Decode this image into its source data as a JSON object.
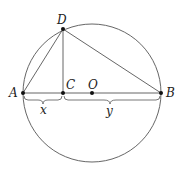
{
  "diagram": {
    "type": "geometry",
    "circle": {
      "center": "O",
      "cx": 92,
      "cy": 93,
      "r": 69
    },
    "points": {
      "A": {
        "label": "A",
        "x": 23,
        "y": 93
      },
      "B": {
        "label": "B",
        "x": 161,
        "y": 93
      },
      "C": {
        "label": "C",
        "x": 63,
        "y": 93
      },
      "O": {
        "label": "O",
        "x": 92,
        "y": 93
      },
      "D": {
        "label": "D",
        "x": 63,
        "y": 29
      }
    },
    "segments": [
      "AB",
      "AD",
      "DB",
      "DC"
    ],
    "braces": {
      "x": {
        "label": "x",
        "from": "A",
        "to": "C"
      },
      "y": {
        "label": "y",
        "from": "C",
        "to": "B"
      }
    },
    "colors": {
      "stroke": "#555555",
      "point": "#111111",
      "text": "#222222"
    }
  }
}
